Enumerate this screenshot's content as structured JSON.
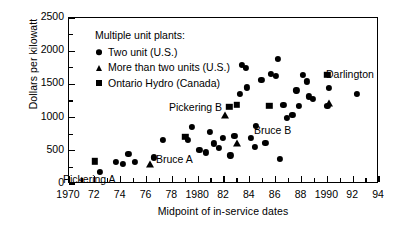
{
  "chart_data": {
    "type": "scatter",
    "title": "",
    "xlabel": "Midpoint of in-service dates",
    "ylabel": "Dollars per kilowatt",
    "xlim": [
      1970,
      1994
    ],
    "ylim": [
      0,
      2500
    ],
    "x_major_ticks": [
      1970,
      1972,
      1974,
      1976,
      1978,
      1980,
      1982,
      1984,
      1986,
      1988,
      1990,
      1992,
      1994
    ],
    "x_tick_labels": [
      "1970",
      "72",
      "74",
      "76",
      "78",
      "1980",
      "82",
      "84",
      "86",
      "88",
      "1990",
      "92",
      "94"
    ],
    "x_minor_step": 1,
    "y_major_ticks": [
      0,
      500,
      1000,
      1500,
      2000,
      2500
    ],
    "y_tick_labels": [
      "0",
      "500",
      "1000",
      "1500",
      "2000",
      "2500"
    ],
    "y_minor_step": 250,
    "grid": false,
    "legend_position": "top-left",
    "legend_title": "Multiple unit plants:",
    "series": [
      {
        "name": "Two unit (U.S.)",
        "marker": "circle",
        "points": [
          [
            1972.4,
            185
          ],
          [
            1973.6,
            330
          ],
          [
            1974.2,
            300
          ],
          [
            1974.6,
            455
          ],
          [
            1975.1,
            330
          ],
          [
            1976.6,
            400
          ],
          [
            1977.3,
            660
          ],
          [
            1979.2,
            660
          ],
          [
            1979.5,
            855
          ],
          [
            1980.1,
            510
          ],
          [
            1980.6,
            475
          ],
          [
            1980.9,
            790
          ],
          [
            1981.2,
            610
          ],
          [
            1981.6,
            545
          ],
          [
            1981.9,
            690
          ],
          [
            1982.5,
            430
          ],
          [
            1982.8,
            720
          ],
          [
            1983.2,
            1360
          ],
          [
            1983.4,
            1790
          ],
          [
            1983.7,
            1745
          ],
          [
            1983.8,
            1455
          ],
          [
            1984.1,
            690
          ],
          [
            1984.4,
            560
          ],
          [
            1984.5,
            870
          ],
          [
            1984.9,
            1570
          ],
          [
            1985.2,
            625
          ],
          [
            1985.6,
            1660
          ],
          [
            1986.0,
            1630
          ],
          [
            1986.2,
            1890
          ],
          [
            1986.3,
            375
          ],
          [
            1986.6,
            1190
          ],
          [
            1986.9,
            995
          ],
          [
            1987.3,
            1040
          ],
          [
            1987.6,
            1410
          ],
          [
            1987.8,
            1180
          ],
          [
            1988.1,
            1640
          ],
          [
            1988.4,
            1545
          ],
          [
            1988.6,
            1320
          ],
          [
            1988.9,
            1285
          ],
          [
            1990.0,
            1180
          ],
          [
            1990.1,
            1445
          ],
          [
            1992.3,
            1355
          ]
        ]
      },
      {
        "name": "More than two units (U.S.)",
        "marker": "triangle",
        "points": [
          [
            1976.3,
            300
          ],
          [
            1982.1,
            1040
          ],
          [
            1983.0,
            615
          ],
          [
            1990.1,
            1225
          ]
        ]
      },
      {
        "name": "Ontario Hydro (Canada)",
        "marker": "square",
        "points": [
          [
            1972.0,
            340
          ],
          [
            1979.0,
            710
          ],
          [
            1982.4,
            1160
          ],
          [
            1983.0,
            1190
          ],
          [
            1985.5,
            1180
          ],
          [
            1990.0,
            1640
          ]
        ]
      }
    ],
    "annotations": [
      {
        "text": "Pickering A",
        "x_px": 62,
        "y_px": 172
      },
      {
        "text": "Pickering B",
        "x_px": 168,
        "y_px": 100
      },
      {
        "text": "Bruce A",
        "x_px": 155,
        "y_px": 152
      },
      {
        "text": "Bruce B",
        "x_px": 253,
        "y_px": 123
      },
      {
        "text": "Darlington",
        "x_px": 325,
        "y_px": 67
      }
    ]
  }
}
